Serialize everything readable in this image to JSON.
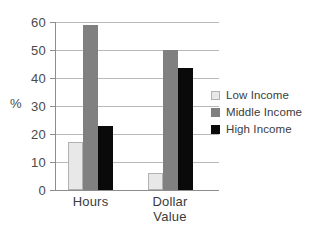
{
  "chart_data": {
    "type": "bar",
    "title": "",
    "subtitle": "",
    "xlabel": "",
    "ylabel": "%",
    "ylim": [
      0,
      60
    ],
    "ytick_labels": [
      "60",
      "50",
      "40",
      "30",
      "20",
      "10",
      "0"
    ],
    "yticks": [
      60,
      50,
      40,
      30,
      20,
      10,
      0
    ],
    "grid": "horizontal",
    "legend_position": "right",
    "categories": [
      "Hours",
      "Dollar Value"
    ],
    "category_label_lines": [
      [
        "Hours"
      ],
      [
        "Dollar",
        "Value"
      ]
    ],
    "series": [
      {
        "name": "Low Income",
        "color": "#e8e8e8",
        "values": [
          17,
          6
        ]
      },
      {
        "name": "Middle Income",
        "color": "#808080",
        "values": [
          59,
          50
        ]
      },
      {
        "name": "High Income",
        "color": "#0a0a0a",
        "values": [
          23,
          43.5
        ]
      }
    ]
  },
  "legend": {
    "items": [
      {
        "label": "Low Income"
      },
      {
        "label": "Middle Income"
      },
      {
        "label": "High Income"
      }
    ]
  }
}
